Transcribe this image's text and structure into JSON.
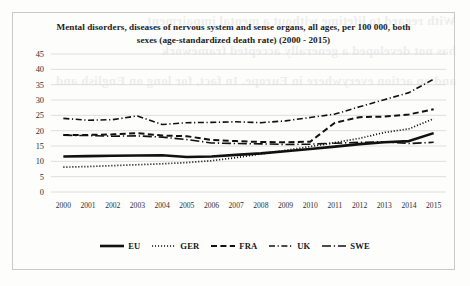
{
  "figure": {
    "border_color": "#c9c9c9",
    "background": "#fdfdfc"
  },
  "bleed_through_lines": [
    "With regard to lifetime without a mental impairment",
    "has not developed a generally accepted framework",
    "and on action everywhere in Europe. In fact, for long on English and"
  ],
  "legend": {
    "position": "bottom-center",
    "entries": [
      {
        "label": "EU",
        "style": "solid-thick",
        "color": "#111111"
      },
      {
        "label": "GER",
        "style": "dotted",
        "color": "#111111"
      },
      {
        "label": "FRA",
        "style": "dashed",
        "color": "#111111"
      },
      {
        "label": "UK",
        "style": "dash-dot",
        "color": "#111111"
      },
      {
        "label": "SWE",
        "style": "long-dash-dot",
        "color": "#111111"
      }
    ]
  },
  "chart_data": {
    "type": "line",
    "title": "Mental disorders, diseases of nervous system and sense organs, all ages, per 100 000, both sexes (age-standardized death rate) (2000 - 2015)",
    "xlabel": "",
    "ylabel": "",
    "grid": true,
    "ylim": [
      0,
      45
    ],
    "yticks": [
      0,
      5,
      10,
      15,
      20,
      25,
      30,
      35,
      40,
      45
    ],
    "categories": [
      "2000",
      "2001",
      "2002",
      "2003",
      "2004",
      "2005",
      "2006",
      "2007",
      "2008",
      "2009",
      "2010",
      "2011",
      "2012",
      "2013",
      "2014",
      "2015"
    ],
    "series": [
      {
        "name": "EU",
        "style": "solid-thick",
        "values": [
          11.6,
          11.7,
          11.8,
          11.9,
          12.0,
          11.4,
          11.6,
          12.1,
          12.6,
          13.3,
          14.0,
          14.8,
          15.6,
          16.2,
          16.6,
          19.2
        ]
      },
      {
        "name": "GER",
        "style": "dotted",
        "values": [
          8.1,
          8.3,
          8.6,
          8.9,
          9.2,
          9.6,
          10.2,
          11.2,
          12.4,
          13.6,
          14.8,
          16.1,
          17.5,
          19.4,
          20.6,
          23.9
        ]
      },
      {
        "name": "FRA",
        "style": "dashed",
        "values": [
          18.6,
          18.6,
          18.8,
          19.2,
          18.4,
          18.2,
          17.0,
          16.6,
          16.3,
          16.2,
          16.4,
          22.6,
          24.4,
          24.6,
          25.3,
          27.0
        ]
      },
      {
        "name": "UK",
        "style": "dash-dot",
        "values": [
          24.0,
          23.4,
          23.6,
          24.8,
          22.0,
          22.6,
          22.7,
          22.9,
          22.6,
          23.2,
          24.3,
          25.4,
          27.8,
          30.1,
          32.4,
          36.8
        ]
      },
      {
        "name": "SWE",
        "style": "long-dash-dot",
        "values": [
          18.5,
          18.4,
          18.2,
          18.3,
          17.9,
          17.1,
          16.0,
          15.8,
          15.7,
          15.5,
          15.6,
          15.9,
          16.2,
          16.4,
          15.8,
          16.2
        ]
      }
    ]
  }
}
